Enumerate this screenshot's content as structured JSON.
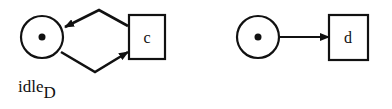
{
  "diagram": {
    "type": "petri-net",
    "left_net": {
      "place": {
        "label": "idle",
        "subscript": "D",
        "tokens": 1
      },
      "transition": {
        "label": "c"
      },
      "arcs": [
        {
          "from": "c",
          "to": "idle_D"
        },
        {
          "from": "idle_D",
          "to": "c"
        }
      ]
    },
    "right_net": {
      "place": {
        "label": "",
        "tokens": 1
      },
      "transition": {
        "label": "d"
      },
      "arcs": [
        {
          "from": "place",
          "to": "d"
        }
      ]
    }
  },
  "colors": {
    "stroke": "#111111",
    "background": "#ffffff"
  }
}
